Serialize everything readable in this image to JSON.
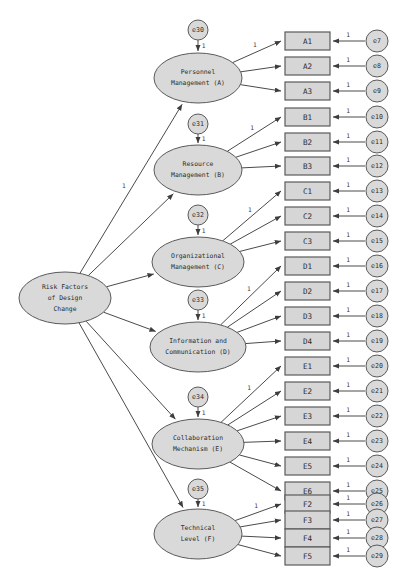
{
  "diagram": {
    "type": "sem-path-diagram",
    "fixed_loading_label": "1",
    "colors": {
      "node_fill": "#d9d9d9",
      "box_fill": "#d6d6d6",
      "stroke": "#5a5a5a",
      "path": "#4a4a4a",
      "text": "#2b2b2b",
      "background": "#ffffff"
    }
  },
  "exogenous": {
    "id": "RF",
    "lines": [
      "Risk Factors",
      "of Design",
      "Change"
    ],
    "cx": 65,
    "cy": 298,
    "rx": 46,
    "ry": 26
  },
  "constructs": [
    {
      "id": "A",
      "lines": [
        "Personnel",
        "Management (A)"
      ],
      "cx": 198,
      "cy": 78,
      "rx": 44,
      "ry": 25,
      "disturbance": "e30",
      "disturbance_cx": 198,
      "disturbance_cy": 30,
      "path_label": "1",
      "loading_label": "1",
      "indicators": [
        "A1",
        "A2",
        "A3"
      ]
    },
    {
      "id": "B",
      "lines": [
        "Resource",
        "Management (B)"
      ],
      "cx": 198,
      "cy": 170,
      "rx": 44,
      "ry": 25,
      "disturbance": "e31",
      "disturbance_cx": 198,
      "disturbance_cy": 124,
      "path_label": "1",
      "loading_label": "1",
      "indicators": [
        "B1",
        "B2",
        "B3"
      ]
    },
    {
      "id": "C",
      "lines": [
        "Organizational",
        "Management (C)"
      ],
      "cx": 198,
      "cy": 262,
      "rx": 46,
      "ry": 25,
      "disturbance": "e32",
      "disturbance_cx": 198,
      "disturbance_cy": 215,
      "path_label": "1",
      "loading_label": "1",
      "indicators": [
        "C1",
        "C2",
        "C3"
      ]
    },
    {
      "id": "D",
      "lines": [
        "Information and",
        "Communication (D)"
      ],
      "cx": 198,
      "cy": 347,
      "rx": 48,
      "ry": 25,
      "disturbance": "e33",
      "disturbance_cx": 198,
      "disturbance_cy": 300,
      "path_label": "1",
      "loading_label": "1",
      "indicators": [
        "D1",
        "D2",
        "D3",
        "D4"
      ]
    },
    {
      "id": "E",
      "lines": [
        "Collaboration",
        "Mechanism (E)"
      ],
      "cx": 198,
      "cy": 444,
      "rx": 46,
      "ry": 25,
      "disturbance": "e34",
      "disturbance_cx": 198,
      "disturbance_cy": 397,
      "path_label": "1",
      "loading_label": "1",
      "indicators": [
        "E1",
        "E2",
        "E3",
        "E4",
        "E5",
        "E6"
      ]
    },
    {
      "id": "F",
      "lines": [
        "Technical",
        "Level (F)"
      ],
      "cx": 198,
      "cy": 534,
      "rx": 44,
      "ry": 25,
      "disturbance": "e35",
      "disturbance_cx": 198,
      "disturbance_cy": 489,
      "path_label": "1",
      "loading_label": "1",
      "indicators": [
        "F2",
        "F3",
        "F4",
        "F5"
      ]
    }
  ],
  "indicators": [
    {
      "label": "A1",
      "error": "e7",
      "y": 41
    },
    {
      "label": "A2",
      "error": "e8",
      "y": 66
    },
    {
      "label": "A3",
      "error": "e9",
      "y": 91
    },
    {
      "label": "B1",
      "error": "e10",
      "y": 117
    },
    {
      "label": "B2",
      "error": "e11",
      "y": 142
    },
    {
      "label": "B3",
      "error": "e12",
      "y": 166
    },
    {
      "label": "C1",
      "error": "e13",
      "y": 191
    },
    {
      "label": "C2",
      "error": "e14",
      "y": 216
    },
    {
      "label": "C3",
      "error": "e15",
      "y": 241
    },
    {
      "label": "D1",
      "error": "e16",
      "y": 266
    },
    {
      "label": "D2",
      "error": "e17",
      "y": 291
    },
    {
      "label": "D3",
      "error": "e18",
      "y": 316
    },
    {
      "label": "D4",
      "error": "e19",
      "y": 341
    },
    {
      "label": "E1",
      "error": "e20",
      "y": 366
    },
    {
      "label": "E2",
      "error": "e21",
      "y": 391
    },
    {
      "label": "E3",
      "error": "e22",
      "y": 416
    },
    {
      "label": "E4",
      "error": "e23",
      "y": 441
    },
    {
      "label": "E5",
      "error": "e24",
      "y": 466
    },
    {
      "label": "E6",
      "error": "e25",
      "y": 491
    },
    {
      "label": "F2",
      "error": "e26",
      "y": 504
    },
    {
      "label": "F3",
      "error": "e27",
      "y": 520
    },
    {
      "label": "F4",
      "error": "e28",
      "y": 538
    },
    {
      "label": "F5",
      "error": "e29",
      "y": 556
    }
  ],
  "layout": {
    "box_x": 285,
    "box_w": 45,
    "box_h": 18,
    "err_cx": 377,
    "err_r": 11,
    "disturbance_r": 10
  },
  "caption": {
    "text": ""
  }
}
